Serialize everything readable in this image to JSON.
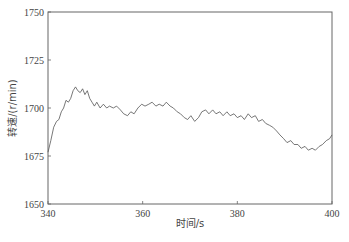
{
  "chart_data": {
    "type": "line",
    "title": "",
    "xlabel": "时间/s",
    "ylabel": "转速/(r/min)",
    "xlim": [
      340,
      400
    ],
    "ylim": [
      1650,
      1750
    ],
    "x_ticks": [
      "340",
      "360",
      "380",
      "400"
    ],
    "y_ticks": [
      "1650",
      "1675",
      "1700",
      "1725",
      "1750"
    ],
    "grid": false,
    "legend": null,
    "series": [
      {
        "name": "转速",
        "color": "#555555",
        "x": [
          340,
          340.6,
          341.2,
          341.8,
          342.3,
          342.8,
          343.3,
          343.8,
          344.3,
          344.8,
          345.3,
          345.8,
          346.3,
          346.8,
          347.3,
          347.8,
          348.3,
          348.8,
          349.3,
          349.8,
          350.3,
          351,
          351.7,
          352.4,
          353,
          353.8,
          354.5,
          355.3,
          356,
          356.8,
          357.5,
          358.2,
          359,
          359.8,
          360.5,
          361.3,
          362,
          362.8,
          363.5,
          364.3,
          365,
          365.8,
          366.5,
          367.3,
          368,
          368.8,
          369.5,
          370.2,
          371,
          371.8,
          372.5,
          373.3,
          374,
          374.8,
          375.5,
          376.3,
          377,
          377.8,
          378.5,
          379.3,
          380,
          380.8,
          381.5,
          382.3,
          383,
          383.8,
          384.5,
          385.3,
          386,
          386.8,
          387.5,
          388.3,
          389,
          389.8,
          390.5,
          391.3,
          392,
          392.8,
          393.5,
          394.3,
          395,
          395.8,
          396.5,
          397.3,
          398,
          398.8,
          399.5,
          400
        ],
        "values": [
          1677,
          1683,
          1690,
          1693,
          1694,
          1698,
          1700,
          1704,
          1703,
          1705,
          1709,
          1711,
          1709,
          1708,
          1710,
          1707,
          1709,
          1705,
          1703,
          1701,
          1703,
          1700,
          1702,
          1700,
          1701,
          1700,
          1701,
          1699,
          1697,
          1696,
          1698,
          1697,
          1700,
          1702,
          1701,
          1702,
          1703,
          1701,
          1702,
          1701,
          1703,
          1701,
          1700,
          1698,
          1697,
          1695,
          1694,
          1696,
          1693,
          1695,
          1698,
          1699,
          1697,
          1699,
          1697,
          1698,
          1696,
          1698,
          1696,
          1697,
          1695,
          1696,
          1694,
          1697,
          1695,
          1696,
          1693,
          1694,
          1692,
          1691,
          1690,
          1688,
          1686,
          1684,
          1682,
          1683,
          1681,
          1681,
          1679,
          1680,
          1678,
          1679,
          1678,
          1680,
          1681,
          1683,
          1684,
          1686
        ]
      }
    ]
  }
}
